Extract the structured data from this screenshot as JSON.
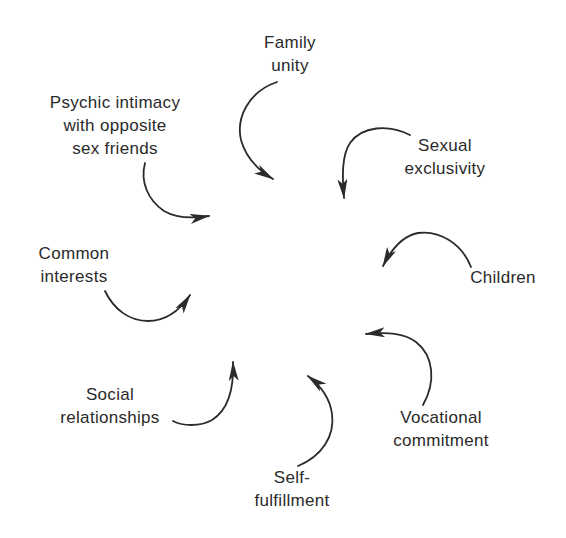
{
  "diagram": {
    "title": "",
    "center_target": "marriage (implicit center, unlabeled)",
    "nodes": [
      {
        "id": "family-unity",
        "lines": [
          "Family",
          "unity"
        ]
      },
      {
        "id": "sexual-exclusivity",
        "lines": [
          "Sexual",
          "exclusivity"
        ]
      },
      {
        "id": "children",
        "lines": [
          "Children"
        ]
      },
      {
        "id": "vocational-commitment",
        "lines": [
          "Vocational",
          "commitment"
        ]
      },
      {
        "id": "self-fulfillment",
        "lines": [
          "Self-",
          "fulfillment"
        ]
      },
      {
        "id": "social-relationships",
        "lines": [
          "Social",
          "relationships"
        ]
      },
      {
        "id": "common-interests",
        "lines": [
          "Common",
          "interests"
        ]
      },
      {
        "id": "psychic-intimacy",
        "lines": [
          "Psychic intimacy",
          "with opposite",
          "sex friends"
        ]
      }
    ],
    "arrows": [
      {
        "from": "family-unity",
        "to": "center"
      },
      {
        "from": "sexual-exclusivity",
        "to": "center"
      },
      {
        "from": "children",
        "to": "center"
      },
      {
        "from": "vocational-commitment",
        "to": "center"
      },
      {
        "from": "self-fulfillment",
        "to": "center"
      },
      {
        "from": "social-relationships",
        "to": "center"
      },
      {
        "from": "common-interests",
        "to": "center"
      },
      {
        "from": "psychic-intimacy",
        "to": "center"
      }
    ],
    "colors": {
      "background": "#ffffff",
      "ink": "#2a2a2a"
    }
  }
}
